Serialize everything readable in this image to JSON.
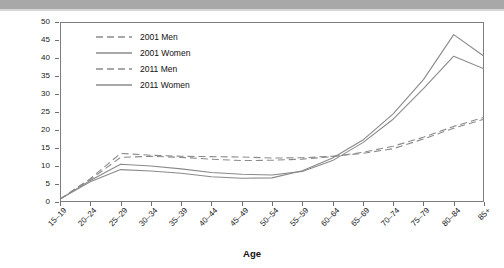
{
  "banner": {
    "present": true,
    "color": "#a8a8a8"
  },
  "chart_data": {
    "type": "line",
    "title": "",
    "xlabel": "Age",
    "ylabel": "Percent",
    "ylim": [
      0,
      50
    ],
    "ytick_step": 5,
    "yticks": [
      0,
      5,
      10,
      15,
      20,
      25,
      30,
      35,
      40,
      45,
      50
    ],
    "grid": false,
    "legend_position": "top-left-inside",
    "categories": [
      "15–19",
      "20–24",
      "25–29",
      "30–34",
      "35–39",
      "40–44",
      "45–49",
      "50–54",
      "55–59",
      "60–64",
      "65–69",
      "70–74",
      "75–79",
      "80–84",
      "85+"
    ],
    "series": [
      {
        "name": "2001 Men",
        "style": "dashed",
        "color": "#8a8a8a",
        "values": [
          0.8,
          6.5,
          13.5,
          13.0,
          12.7,
          12.6,
          12.5,
          12.2,
          12.3,
          12.7,
          13.5,
          14.8,
          17.5,
          20.5,
          23.0
        ]
      },
      {
        "name": "2001 Women",
        "style": "solid",
        "color": "#8a8a8a",
        "values": [
          0.8,
          6.0,
          10.5,
          10.0,
          9.2,
          8.2,
          7.7,
          7.5,
          8.5,
          11.5,
          16.5,
          23.0,
          31.5,
          40.5,
          37.0
        ]
      },
      {
        "name": "2011 Men",
        "style": "dashed",
        "color": "#8a8a8a",
        "values": [
          0.8,
          6.2,
          12.4,
          12.7,
          12.4,
          11.9,
          11.5,
          11.6,
          11.9,
          12.6,
          13.8,
          15.5,
          18.0,
          21.0,
          23.5
        ]
      },
      {
        "name": "2011 Women",
        "style": "solid",
        "color": "#8a8a8a",
        "values": [
          0.8,
          5.6,
          9.0,
          8.6,
          8.0,
          7.0,
          6.6,
          6.7,
          8.7,
          12.2,
          17.2,
          24.5,
          34.0,
          46.5,
          40.5
        ]
      }
    ]
  },
  "legend": {
    "items": [
      {
        "label": "2001 Men",
        "style": "dashed"
      },
      {
        "label": "2001 Women",
        "style": "solid"
      },
      {
        "label": "2011 Men",
        "style": "dashed"
      },
      {
        "label": "2011 Women",
        "style": "solid"
      }
    ]
  },
  "axes": {
    "y_title": "Percent",
    "x_title": "Age"
  }
}
